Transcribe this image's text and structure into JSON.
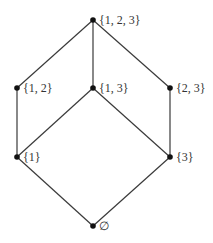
{
  "diagram": {
    "type": "hasse-diagram",
    "title": "",
    "colors": {
      "edge": "#3a3a3a",
      "node": "#111111",
      "label": "#333333",
      "background": "#ffffff"
    },
    "nodes": [
      {
        "id": "n123",
        "label": "{1, 2, 3}",
        "x": 93,
        "y": 20
      },
      {
        "id": "n12",
        "label": "{1, 2}",
        "x": 17,
        "y": 88
      },
      {
        "id": "n13",
        "label": "{1, 3}",
        "x": 93,
        "y": 88
      },
      {
        "id": "n23",
        "label": "{2, 3}",
        "x": 170,
        "y": 88
      },
      {
        "id": "n1",
        "label": "{1}",
        "x": 17,
        "y": 157
      },
      {
        "id": "n3",
        "label": "{3}",
        "x": 170,
        "y": 157
      },
      {
        "id": "nempty",
        "label": "∅",
        "x": 93,
        "y": 226
      }
    ],
    "edges": [
      {
        "from": "n123",
        "to": "n12"
      },
      {
        "from": "n123",
        "to": "n13"
      },
      {
        "from": "n123",
        "to": "n23"
      },
      {
        "from": "n12",
        "to": "n1"
      },
      {
        "from": "n13",
        "to": "n1"
      },
      {
        "from": "n13",
        "to": "n3"
      },
      {
        "from": "n23",
        "to": "n3"
      },
      {
        "from": "n1",
        "to": "nempty"
      },
      {
        "from": "n3",
        "to": "nempty"
      }
    ]
  }
}
